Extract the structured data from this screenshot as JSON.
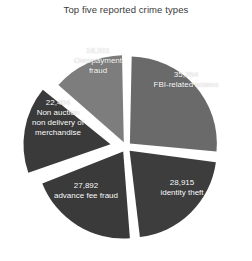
{
  "chart_data": {
    "type": "pie",
    "title": "Top five reported crime types",
    "xlabel": "",
    "ylabel": "",
    "legend": "none",
    "grid": false,
    "total": 133486,
    "categories": [
      "FBI-related scams",
      "identity theft",
      "advance fee fraud",
      "Non auction non delivery of merchandise",
      "Overpayment fraud"
    ],
    "values": [
      35764,
      28915,
      27892,
      22404,
      18511
    ],
    "value_labels": [
      "35,764",
      "28,915",
      "27,892",
      "22,404",
      "18,511"
    ],
    "percentages": [
      26.8,
      21.7,
      20.9,
      16.8,
      13.9
    ],
    "colors": [
      "#6a6a6a",
      "#3d3d3d",
      "#3a3a3a",
      "#3a3a3a",
      "#7d7d7d"
    ],
    "slices": [
      {
        "name": "FBI-related scams",
        "value": 35764,
        "value_label": "35,764",
        "label_lines": [
          "35,764",
          "FBI-related scams"
        ],
        "percent": 26.8,
        "color": "#6a6a6a"
      },
      {
        "name": "identity theft",
        "value": 28915,
        "value_label": "28,915",
        "label_lines": [
          "28,915",
          "identity theft"
        ],
        "percent": 21.7,
        "color": "#3d3d3d"
      },
      {
        "name": "advance fee fraud",
        "value": 27892,
        "value_label": "27,892",
        "label_lines": [
          "27,892",
          "advance fee fraud"
        ],
        "percent": 20.9,
        "color": "#3a3a3a"
      },
      {
        "name": "Non auction non delivery of merchandise",
        "value": 22404,
        "value_label": "22,404",
        "label_lines": [
          "22,404",
          "Non auction",
          "non delivery of",
          "merchandise"
        ],
        "percent": 16.8,
        "color": "#3a3a3a"
      },
      {
        "name": "Overpayment fraud",
        "value": 18511,
        "value_label": "18,511",
        "label_lines": [
          "18,511",
          "Overpayment",
          "fraud"
        ],
        "percent": 13.9,
        "color": "#7d7d7d"
      }
    ]
  },
  "labels": {
    "fbi": {
      "value": "35,764",
      "name": "FBI-related scams"
    },
    "identity": {
      "value": "28,915",
      "name": "identity theft"
    },
    "advance": {
      "value": "27,892",
      "name": "advance fee fraud"
    },
    "nonauction": {
      "value": "22,404",
      "line1": "Non auction",
      "line2": "non delivery of",
      "line3": "merchandise"
    },
    "overpayment": {
      "value": "18,511",
      "line1": "Overpayment",
      "line2": "fraud"
    }
  },
  "style": {
    "background": "#ffffff",
    "title_color": "#3a3a3a",
    "label_color": "#ffffff",
    "gap_color": "#ffffff"
  }
}
